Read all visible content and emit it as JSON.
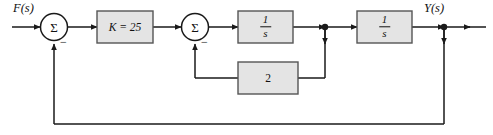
{
  "figure": {
    "type": "control-system-block-diagram",
    "background": "#ffffff",
    "line_color": "#1a1a1a",
    "block_fill": "#e4e4e4",
    "block_stroke": "#555555"
  },
  "labels": {
    "input": "F(s)",
    "output": "Y(s)"
  },
  "summing_junctions": [
    {
      "id": "sum1",
      "symbol": "Σ",
      "feedback_sign": "−"
    },
    {
      "id": "sum2",
      "symbol": "Σ",
      "feedback_sign": "−"
    }
  ],
  "blocks": [
    {
      "id": "gain-k",
      "label": "K = 25",
      "kind": "plain"
    },
    {
      "id": "integrator-1",
      "numerator": "1",
      "denominator": "s",
      "kind": "fraction"
    },
    {
      "id": "integrator-2",
      "numerator": "1",
      "denominator": "s",
      "kind": "fraction"
    },
    {
      "id": "inner-feedback-gain",
      "label": "2",
      "kind": "plain"
    }
  ],
  "loops": [
    {
      "id": "inner-loop",
      "from": "node-after-integrator-1",
      "through": "inner-feedback-gain",
      "to": "sum2",
      "sign": "−"
    },
    {
      "id": "outer-loop",
      "from": "node-output",
      "through": "direct",
      "to": "sum1",
      "sign": "−"
    }
  ]
}
